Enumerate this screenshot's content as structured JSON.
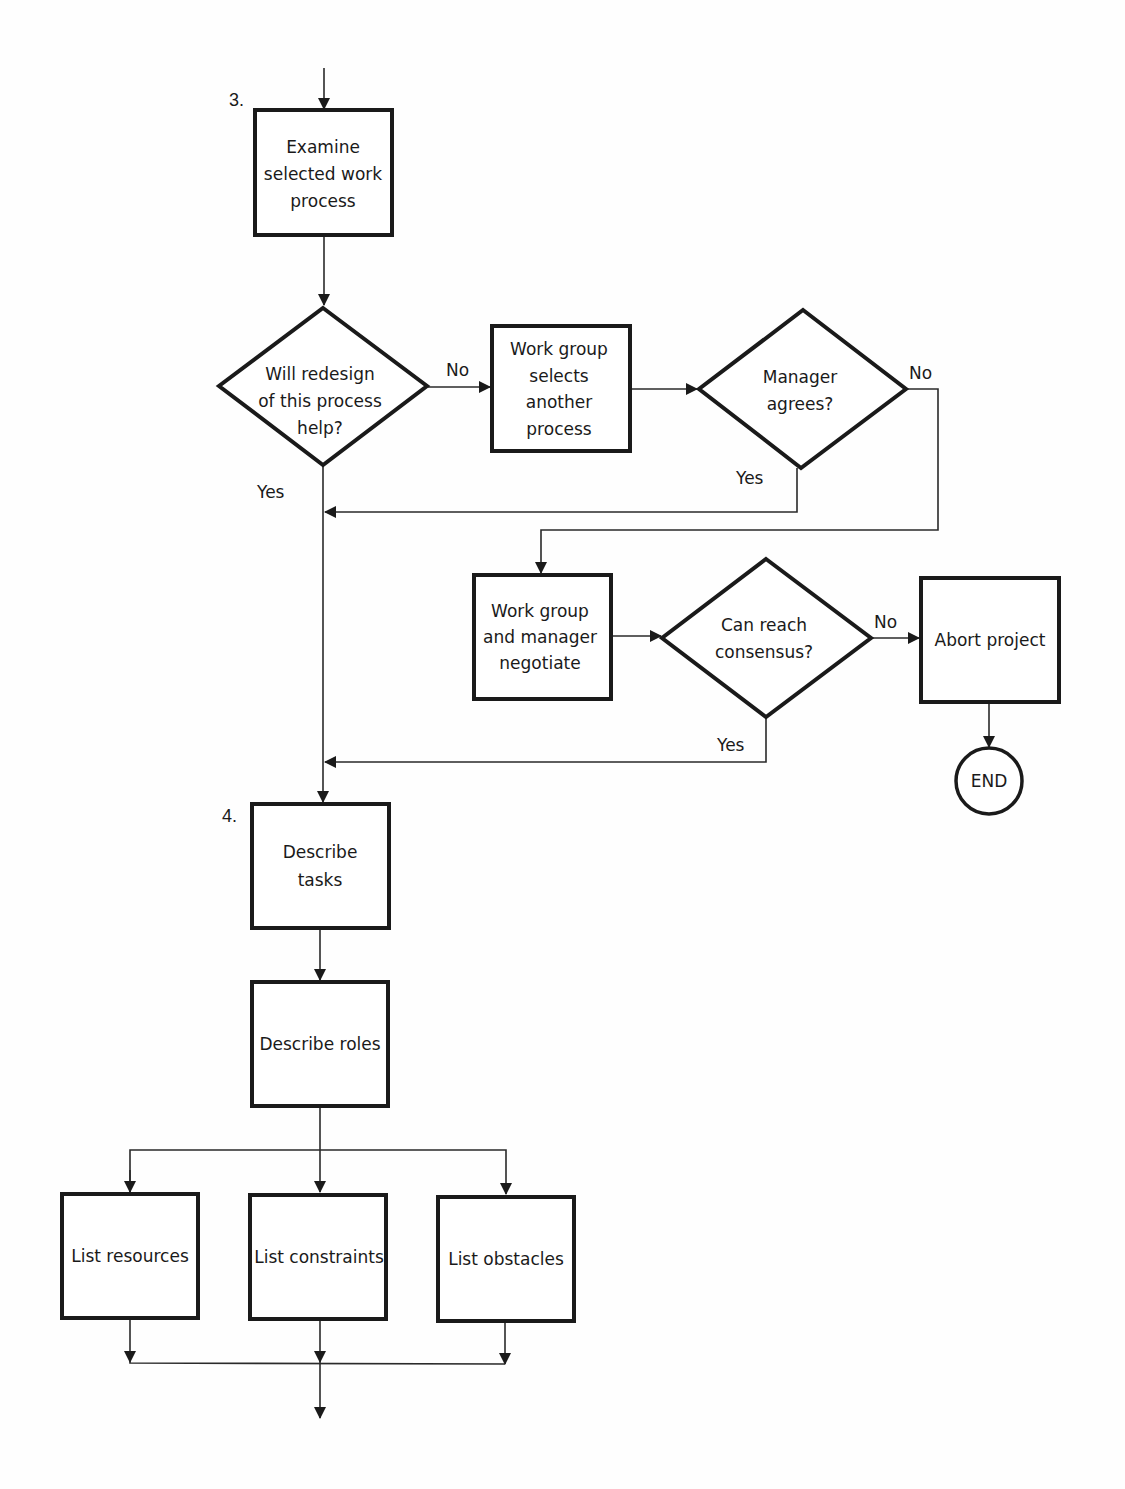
{
  "steps": {
    "step3": {
      "number": "3.",
      "lines": [
        "Examine",
        "selected work",
        "process"
      ]
    },
    "step4": {
      "number": "4.",
      "lines": [
        "Describe",
        "tasks"
      ]
    }
  },
  "nodes": {
    "redesign_decision": {
      "lines": [
        "Will redesign",
        "of this process",
        "help?"
      ]
    },
    "select_another": {
      "lines": [
        "Work group",
        "selects",
        "another",
        "process"
      ]
    },
    "manager_agrees": {
      "lines": [
        "Manager",
        "agrees?"
      ]
    },
    "negotiate": {
      "lines": [
        "Work group",
        "and manager",
        "negotiate"
      ]
    },
    "consensus": {
      "lines": [
        "Can reach",
        "consensus?"
      ]
    },
    "abort": {
      "lines": [
        "Abort project"
      ]
    },
    "end": {
      "lines": [
        "END"
      ]
    },
    "describe_roles": {
      "lines": [
        "Describe roles"
      ]
    },
    "list_resources": {
      "lines": [
        "List resources"
      ]
    },
    "list_constraints": {
      "lines": [
        "List constraints"
      ]
    },
    "list_obstacles": {
      "lines": [
        "List obstacles"
      ]
    }
  },
  "edges": {
    "redesign_no": "No",
    "redesign_yes": "Yes",
    "manager_no": "No",
    "manager_yes": "Yes",
    "consensus_no": "No",
    "consensus_yes": "Yes"
  }
}
